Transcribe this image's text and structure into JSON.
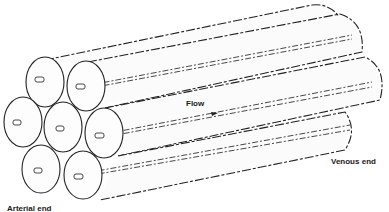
{
  "diagram": {
    "labels": {
      "flow": "Flow",
      "venous_end": "Venous end",
      "arterial_end": "Arterial end"
    },
    "tube_count": 7,
    "colors": {
      "line": "#222222",
      "fill": "#fbfbfb",
      "background": "#ffffff"
    }
  }
}
